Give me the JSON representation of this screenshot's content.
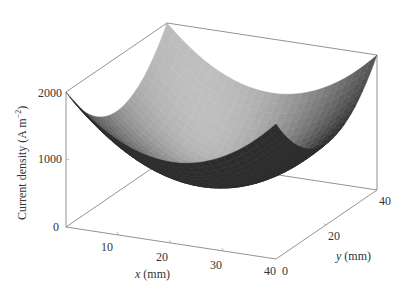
{
  "chart_data": {
    "type": "surface3d",
    "title": "",
    "xlabel_var": "x",
    "xlabel_unit": "(mm)",
    "ylabel_var": "y",
    "ylabel_unit": "(mm)",
    "zlabel": "Current density (A m",
    "zlabel_sup": "−2",
    "zlabel_close": ")",
    "x_ticks": [
      "10",
      "20",
      "30",
      "40"
    ],
    "y_ticks": [
      "0",
      "20",
      "40"
    ],
    "z_ticks": [
      "0",
      "1000",
      "2000"
    ],
    "xlim": [
      0,
      40
    ],
    "ylim": [
      0,
      40
    ],
    "zlim": [
      0,
      2000
    ],
    "surface": {
      "description": "Paraboloid bowl, minimum near center (x=20,y=20), rising to ~2000 at corners",
      "model": "z = 400 + 2*((x-20)^2 + (y-20)^2)",
      "x": [
        0,
        10,
        20,
        30,
        40
      ],
      "y": [
        0,
        10,
        20,
        30,
        40
      ],
      "z": [
        [
          2000,
          1400,
          1200,
          1400,
          2000
        ],
        [
          1400,
          800,
          600,
          800,
          1400
        ],
        [
          1200,
          600,
          400,
          600,
          1200
        ],
        [
          1400,
          800,
          600,
          800,
          1400
        ],
        [
          2000,
          1400,
          1200,
          1400,
          2000
        ]
      ]
    },
    "colormap": "grayscale",
    "grid": false
  }
}
